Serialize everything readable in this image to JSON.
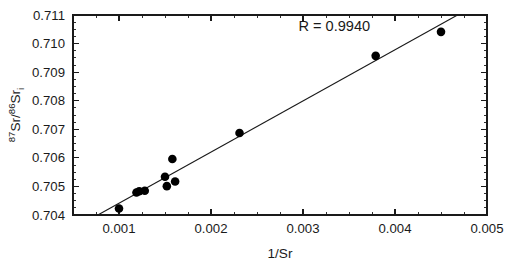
{
  "chart_data": {
    "type": "scatter",
    "title": "",
    "xlabel": "1/Sr",
    "ylabel_main": "Sr/",
    "ylabel_sup1": "87",
    "ylabel_sup2": "86",
    "ylabel_main2": "Sr",
    "ylabel_sub": "i",
    "xlim": [
      0.0005,
      0.005
    ],
    "ylim": [
      0.704,
      0.711
    ],
    "grid": false,
    "legend": null,
    "annotations": [
      {
        "text": "R = 0.9940",
        "x": 0.00295,
        "y": 0.71045
      }
    ],
    "xticks": [
      0.001,
      0.002,
      0.003,
      0.004,
      0.005
    ],
    "xtick_labels": [
      "0.001",
      "0.002",
      "0.003",
      "0.004",
      "0.005"
    ],
    "xminor_step": 0.00025,
    "yticks": [
      0.704,
      0.705,
      0.706,
      0.707,
      0.708,
      0.709,
      0.71,
      0.711
    ],
    "ytick_labels": [
      "0.704",
      "0.705",
      "0.706",
      "0.707",
      "0.708",
      "0.709",
      "0.710",
      "0.711"
    ],
    "yminor_step": 0.00025,
    "points": [
      {
        "x": 0.001,
        "y": 0.70423
      },
      {
        "x": 0.00119,
        "y": 0.70479
      },
      {
        "x": 0.00122,
        "y": 0.70483
      },
      {
        "x": 0.00128,
        "y": 0.70485
      },
      {
        "x": 0.0015,
        "y": 0.70534
      },
      {
        "x": 0.00152,
        "y": 0.70501
      },
      {
        "x": 0.00158,
        "y": 0.70596
      },
      {
        "x": 0.00161,
        "y": 0.70517
      },
      {
        "x": 0.00231,
        "y": 0.70687
      },
      {
        "x": 0.00379,
        "y": 0.70957
      },
      {
        "x": 0.0045,
        "y": 0.71041
      }
    ],
    "fit_line": {
      "label": "regression-line",
      "x_start": 0.00077,
      "y_start": 0.704,
      "x_end": 0.00468,
      "y_end": 0.711,
      "r_value": "0.9940"
    },
    "point_radius_px": 4.3,
    "colors": {
      "axis": "#1a1a1a",
      "marker": "#000000",
      "line": "#1a1a1a",
      "background": "#ffffff"
    }
  }
}
